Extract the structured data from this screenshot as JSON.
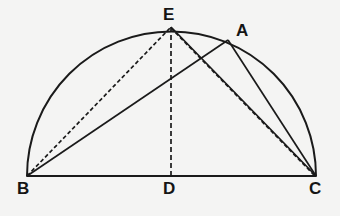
{
  "figure": {
    "background_color": "#f4f4f3",
    "ink_color": "#1a1a1a",
    "width": 340,
    "height": 216,
    "labels": [
      {
        "id": "label-E",
        "text": "E",
        "x": 163,
        "y": 6
      },
      {
        "id": "label-A",
        "text": "A",
        "x": 236,
        "y": 22
      },
      {
        "id": "label-B",
        "text": "B",
        "x": 17,
        "y": 180
      },
      {
        "id": "label-D",
        "text": "D",
        "x": 163,
        "y": 180
      },
      {
        "id": "label-C",
        "text": "C",
        "x": 309,
        "y": 180
      }
    ],
    "points": {
      "B": {
        "x": 27,
        "y": 176
      },
      "C": {
        "x": 316,
        "y": 176
      },
      "D": {
        "x": 171,
        "y": 176
      },
      "E": {
        "x": 171,
        "y": 27
      },
      "A": {
        "x": 228,
        "y": 40
      }
    },
    "arc": {
      "description": "semicircular arc from B over E and A to C",
      "path": "M 27 176 A 144.5 144.5 0 0 1 316 176",
      "stroke_width": 2
    },
    "segments": [
      {
        "id": "segment-BC",
        "from": "B",
        "to": "C",
        "style": "solid",
        "stroke_width": 2
      },
      {
        "id": "segment-BA",
        "from": "B",
        "to": "A",
        "style": "solid",
        "stroke_width": 1.7
      },
      {
        "id": "segment-AC",
        "from": "A",
        "to": "C",
        "style": "solid",
        "stroke_width": 1.7
      },
      {
        "id": "segment-EC",
        "from": "E",
        "to": "C",
        "style": "solid",
        "stroke_width": 1.7
      },
      {
        "id": "segment-BE",
        "from": "B",
        "to": "E",
        "style": "dashed",
        "stroke_width": 1.7,
        "dash": "4,2.5"
      },
      {
        "id": "segment-ED",
        "from": "E",
        "to": "D",
        "style": "dashed",
        "stroke_width": 1.7,
        "dash": "5,3"
      },
      {
        "id": "segment-EC-dashed",
        "from": "E",
        "to": "C",
        "style": "dashed",
        "stroke_width": 1.7,
        "dash": "4,2.5"
      }
    ]
  }
}
